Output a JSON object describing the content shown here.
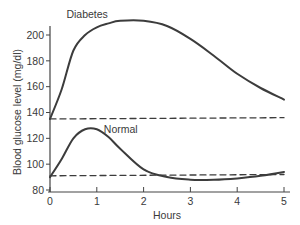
{
  "chart_data": {
    "type": "line",
    "title": "",
    "xlabel": "Hours",
    "ylabel": "Blood glucose level (mg/dl)",
    "xlim": [
      0,
      5
    ],
    "ylim": [
      80,
      200
    ],
    "xticks": [
      0,
      1,
      2,
      3,
      4,
      5
    ],
    "yticks": [
      80,
      100,
      120,
      140,
      160,
      180,
      200
    ],
    "grid": false,
    "legend": "inline labels",
    "x": [
      0,
      0.25,
      0.5,
      0.75,
      1,
      1.25,
      1.5,
      2,
      2.5,
      3,
      3.5,
      4,
      4.5,
      5
    ],
    "series": [
      {
        "name": "Diabetes",
        "style": "solid",
        "values": [
          135,
          158,
          188,
          200,
          206,
          209,
          211,
          211,
          207,
          197,
          184,
          170,
          159,
          150
        ]
      },
      {
        "name": "Normal",
        "style": "solid",
        "values": [
          90,
          104,
          120,
          127,
          127,
          121,
          112,
          96,
          90,
          88,
          88,
          89,
          91,
          94
        ]
      },
      {
        "name": "Diabetes baseline",
        "style": "dashed",
        "values": [
          135,
          135,
          135,
          135,
          135,
          135,
          135,
          135,
          135,
          135,
          135,
          135,
          135,
          136
        ]
      },
      {
        "name": "Normal baseline",
        "style": "dashed",
        "values": [
          91,
          91,
          91,
          91,
          91,
          91,
          91,
          91,
          91,
          91,
          91,
          91,
          91,
          92
        ]
      }
    ],
    "annotations": [
      {
        "text": "Diabetes",
        "x": 0.35,
        "y": 213
      },
      {
        "text": "Normal",
        "x": 1.15,
        "y": 124
      }
    ]
  },
  "colors": {
    "line": "#3c3c3c",
    "axis": "#444444",
    "background": "#ffffff"
  }
}
